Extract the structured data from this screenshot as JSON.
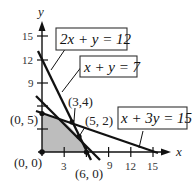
{
  "axes": {
    "x_label": "x",
    "y_label": "y",
    "x_ticks": [
      "3",
      "9",
      "12",
      "15"
    ],
    "y_ticks": [
      "15",
      "12",
      "9"
    ]
  },
  "lines": [
    {
      "equation": "2x + y = 12",
      "x_intercept": 6,
      "y_intercept": 12
    },
    {
      "equation": "x + y = 7",
      "x_intercept": 7,
      "y_intercept": 7
    },
    {
      "equation": "x + 3y = 15",
      "x_intercept": 15,
      "y_intercept": 5
    }
  ],
  "vertices": [
    {
      "label": "(0, 0)"
    },
    {
      "label": "(0, 5)"
    },
    {
      "label": "(3,4)"
    },
    {
      "label": "(5, 2)"
    },
    {
      "label": "(6, 0)"
    }
  ],
  "colors": {
    "feasible_region": "#bdbdbd",
    "lines": "#111111"
  }
}
